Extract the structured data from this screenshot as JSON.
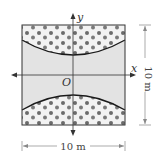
{
  "figure": {
    "axes": {
      "x_label": "x",
      "y_label": "y",
      "origin_label": "O"
    },
    "dimensions": {
      "width_label": "10 m",
      "height_label": "10 m"
    },
    "colors": {
      "channel_fill": "#e3e3e3",
      "pattern_bg": "#f2f2f2",
      "dot": "#6b6b6b",
      "line": "#1a1a1a",
      "dim_line": "#888888"
    }
  }
}
